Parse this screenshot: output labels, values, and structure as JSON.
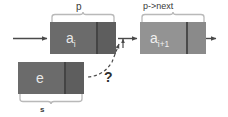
{
  "diagram": {
    "title_visible": false,
    "background_color": "#ffffff",
    "labels": {
      "pointer_p": "p",
      "pointer_p_next": "p->next",
      "new_node_brace": "s",
      "question": "?"
    },
    "nodes": [
      {
        "id": "current",
        "data_label": "a",
        "data_subscript": "i",
        "fill_color": "#6b6b6b",
        "pointer_cell_color": "#5e5e5e",
        "brace_label": "p",
        "brace_side": "top"
      },
      {
        "id": "next",
        "data_label": "a",
        "data_subscript": "i+1",
        "fill_color": "#939393",
        "pointer_cell_color": "#8a8a8a",
        "brace_label": "p->next",
        "brace_side": "top"
      },
      {
        "id": "new",
        "data_label": "e",
        "data_subscript": "",
        "fill_color": "#6b6b6b",
        "pointer_cell_color": "#5e5e5e",
        "brace_label": "s",
        "brace_side": "bottom"
      }
    ],
    "arrows": [
      {
        "id": "incoming",
        "style": "solid",
        "from": "left-edge",
        "to": "current-node"
      },
      {
        "id": "current-to-next",
        "style": "solid",
        "from": "current-pointer",
        "to": "next-node"
      },
      {
        "id": "outgoing",
        "style": "solid",
        "from": "next-pointer",
        "to": "right-edge"
      },
      {
        "id": "insert-question",
        "style": "dashed",
        "from": "new-node-pointer",
        "to": "link-between-nodes",
        "label": "?"
      }
    ],
    "colors": {
      "node_dark": "#6b6b6b",
      "node_light": "#939393",
      "arrow": "#4a4a4a",
      "brace": "#b9b9b9",
      "text_on_node": "#e8e8e8",
      "text_label": "#3a3a3a"
    }
  }
}
